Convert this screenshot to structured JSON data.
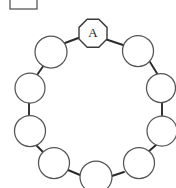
{
  "figure": {
    "background_color": "#ffffff",
    "width": 176,
    "height": 188,
    "edge_color": "#2b2b2b",
    "node_fill": "#ffffff",
    "node_stroke": "#555555",
    "label_color": "#1a1a1a"
  },
  "crop_box": {
    "name": "partial-label-box",
    "x": 10,
    "y": -4,
    "width": 27,
    "height": 13,
    "stroke_color": "#4a4a4a",
    "text": ""
  },
  "ring": {
    "center_x": 88,
    "center_y": 113,
    "radius": 62,
    "node_count": 11,
    "topology": "cycle"
  },
  "nodes": [
    {
      "id": "A",
      "label": "A",
      "shape": "octagon",
      "cx": 93,
      "cy": 33,
      "r": 14,
      "label_visible": true
    },
    {
      "id": "n1",
      "label": "",
      "shape": "circle",
      "cx": 138,
      "cy": 51,
      "r": 15.5,
      "label_visible": false
    },
    {
      "id": "n2",
      "label": "",
      "shape": "circle",
      "cx": 161,
      "cy": 88,
      "r": 14.5,
      "label_visible": false
    },
    {
      "id": "n3",
      "label": "",
      "shape": "circle",
      "cx": 162,
      "cy": 131,
      "r": 15.0,
      "label_visible": false
    },
    {
      "id": "n4",
      "label": "",
      "shape": "circle",
      "cx": 139,
      "cy": 163,
      "r": 15.5,
      "label_visible": false
    },
    {
      "id": "n5",
      "label": "",
      "shape": "circle",
      "cx": 96,
      "cy": 177,
      "r": 16.0,
      "label_visible": false
    },
    {
      "id": "n6",
      "label": "",
      "shape": "circle",
      "cx": 54,
      "cy": 163,
      "r": 15.5,
      "label_visible": false
    },
    {
      "id": "n7",
      "label": "",
      "shape": "circle",
      "cx": 30,
      "cy": 131,
      "r": 15.5,
      "label_visible": false
    },
    {
      "id": "n8",
      "label": "",
      "shape": "circle",
      "cx": 30,
      "cy": 88,
      "r": 15.0,
      "label_visible": false
    },
    {
      "id": "n9",
      "label": "",
      "shape": "circle",
      "cx": 51,
      "cy": 52,
      "r": 16.0,
      "label_visible": false
    },
    {
      "id": "n10",
      "label": "",
      "shape": "circle",
      "cx": 93,
      "cy": 33,
      "r": 14.0,
      "label_visible": false
    }
  ],
  "edges": [
    {
      "from": "A",
      "to": "n1"
    },
    {
      "from": "n1",
      "to": "n2"
    },
    {
      "from": "n2",
      "to": "n3"
    },
    {
      "from": "n3",
      "to": "n4"
    },
    {
      "from": "n4",
      "to": "n5"
    },
    {
      "from": "n5",
      "to": "n6"
    },
    {
      "from": "n6",
      "to": "n7"
    },
    {
      "from": "n7",
      "to": "n8"
    },
    {
      "from": "n8",
      "to": "n9"
    },
    {
      "from": "n9",
      "to": "A"
    }
  ],
  "legend": {
    "caption": ""
  }
}
